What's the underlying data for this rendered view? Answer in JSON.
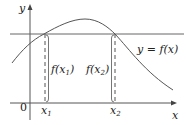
{
  "diagram": {
    "axes": {
      "x_label": "x",
      "y_label": "y",
      "origin_label": "0"
    },
    "curve_label": "y = f(x)",
    "points": [
      {
        "name": "x",
        "sub": "1",
        "value_label_pre": "f(x",
        "value_label_post": ")"
      },
      {
        "name": "x",
        "sub": "2",
        "value_label_pre": "f(x",
        "value_label_post": ")"
      }
    ],
    "colors": {
      "stroke": "#555555",
      "text": "#222222",
      "background": "#ffffff"
    }
  }
}
